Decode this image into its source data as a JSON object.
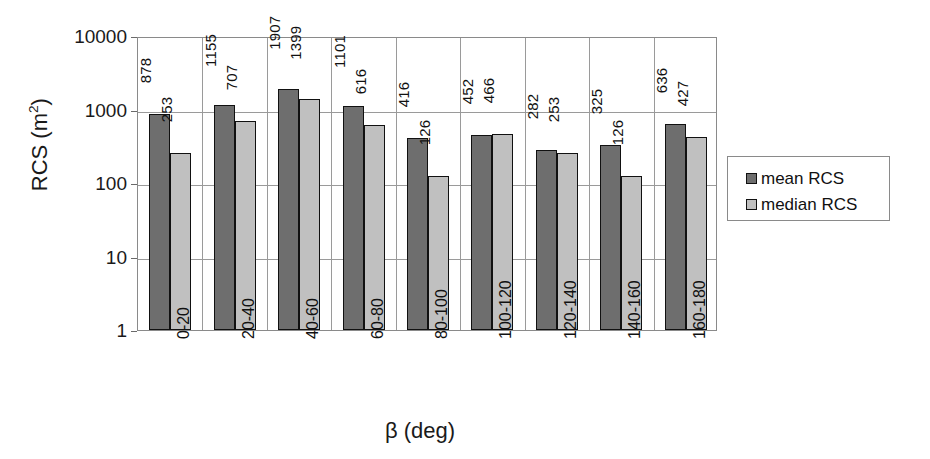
{
  "chart_data": {
    "type": "bar",
    "title": "",
    "subtitle": "",
    "xlabel": "β (deg)",
    "ylabel": "RCS (m",
    "ylabel_sup": "2",
    "ylabel_suffix": ")",
    "categories": [
      "0-20",
      "20-40",
      "40-60",
      "60-80",
      "80-100",
      "100-120",
      "120-140",
      "140-160",
      "160-180"
    ],
    "series": [
      {
        "name": "mean RCS",
        "color": "#6e6e6e",
        "values": [
          878,
          1155,
          1907,
          1101,
          416,
          452,
          282,
          325,
          636
        ]
      },
      {
        "name": "median RCS",
        "color": "#c0c0c0",
        "values": [
          253,
          707,
          1399,
          616,
          126,
          466,
          253,
          126,
          427
        ]
      }
    ],
    "yscale": "log",
    "ylim": [
      1,
      10000
    ],
    "yticks": [
      10000,
      1000,
      100,
      10,
      1
    ],
    "ytick_labels": [
      "10000",
      "1000",
      "100",
      "10",
      "1"
    ],
    "grid": {
      "horizontal": true,
      "vertical": true
    },
    "legend": {
      "position": "right",
      "bordered": true
    },
    "xtick_rotation": -90,
    "value_label_rotation": -90
  },
  "legend": {
    "entries": [
      {
        "label": "mean RCS"
      },
      {
        "label": "median RCS"
      }
    ]
  }
}
